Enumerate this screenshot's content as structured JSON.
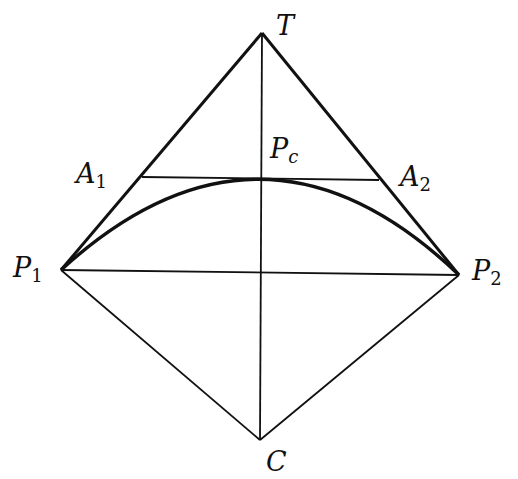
{
  "diagram": {
    "stroke_color": "#111111",
    "background": "#ffffff",
    "points": {
      "T": {
        "x": 262,
        "y": 33
      },
      "P1": {
        "x": 61,
        "y": 270
      },
      "P2": {
        "x": 459,
        "y": 275
      },
      "C": {
        "x": 260,
        "y": 440
      },
      "A1": {
        "x": 142,
        "y": 177
      },
      "A2": {
        "x": 379,
        "y": 180
      },
      "Pc": {
        "x": 262,
        "y": 178
      }
    },
    "labels": {
      "T": {
        "main": "T",
        "sub": ""
      },
      "A1": {
        "main": "A",
        "sub": "1"
      },
      "A2": {
        "main": "A",
        "sub": "2"
      },
      "Pc": {
        "main": "P",
        "sub": "c"
      },
      "P1": {
        "main": "P",
        "sub": "1"
      },
      "P2": {
        "main": "P",
        "sub": "2"
      },
      "C": {
        "main": "C",
        "sub": ""
      }
    }
  }
}
